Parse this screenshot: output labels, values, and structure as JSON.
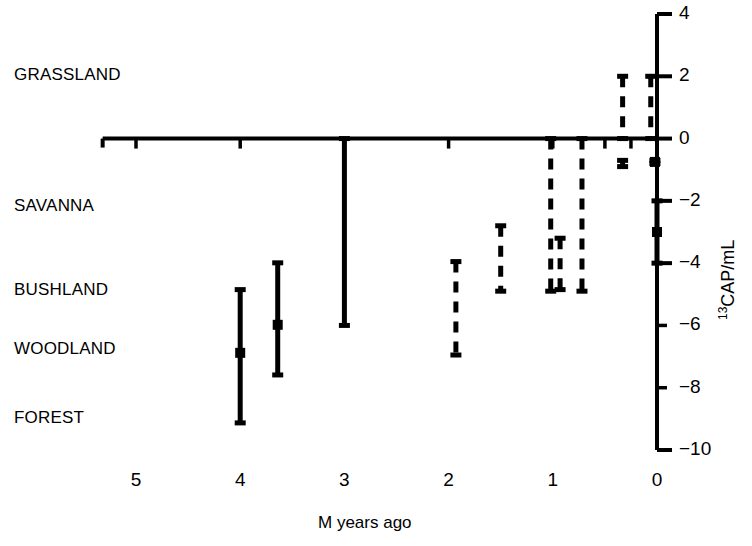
{
  "chart_data": {
    "type": "scatter",
    "title": "",
    "subtitle": "",
    "xlabel": "M years ago",
    "ylabel": "13CAP/mL",
    "ylabel_superscript": "13",
    "ylabel_base": "CAP/mL",
    "xlim": [
      5.3,
      -0.25
    ],
    "ylim": [
      -10,
      4
    ],
    "x_ticks": [
      5,
      4,
      3,
      2,
      1,
      0
    ],
    "y_ticks": [
      4,
      2,
      0,
      -2,
      -4,
      -6,
      -8,
      -10
    ],
    "y_tick_labels": [
      "4",
      "2",
      "0",
      "−2",
      "−4",
      "−6",
      "−8",
      "−10"
    ],
    "grid": false,
    "legend": false,
    "x_axis_position_y": 0,
    "y_axis_position_x": 0,
    "biome_bands": [
      {
        "label": "GRASSLAND",
        "value": 2.0
      },
      {
        "label": "SAVANNA",
        "value": -2.2
      },
      {
        "label": "BUSHLAND",
        "value": -4.9
      },
      {
        "label": "WOODLAND",
        "value": -6.8
      },
      {
        "label": "FOREST",
        "value": -9.0
      }
    ],
    "series": [
      {
        "name": "solid-intervals",
        "style": "solid",
        "points": [
          {
            "x": 4.0,
            "y": -6.88,
            "low": -9.13,
            "high": -4.85,
            "has_point": true
          },
          {
            "x": 3.64,
            "y": -5.98,
            "low": -7.59,
            "high": -3.99,
            "has_point": true
          },
          {
            "x": 3.0,
            "y": null,
            "low": -6.0,
            "high": 0.0,
            "has_point": false
          },
          {
            "x": 0.0,
            "y": -3.0,
            "low": -4.0,
            "high": -2.0,
            "has_point": true
          },
          {
            "x": 0.02,
            "y": -0.75,
            "low": -0.8,
            "high": -0.7,
            "has_point": true
          }
        ]
      },
      {
        "name": "dashed-intervals",
        "style": "dashed",
        "points": [
          {
            "x": 1.93,
            "y": null,
            "low": -6.95,
            "high": -3.95,
            "has_point": false
          },
          {
            "x": 1.5,
            "y": null,
            "low": -4.9,
            "high": -2.8,
            "has_point": false
          },
          {
            "x": 1.02,
            "y": null,
            "low": -4.9,
            "high": 0.0,
            "has_point": false
          },
          {
            "x": 0.93,
            "y": null,
            "low": -4.85,
            "high": -3.2,
            "has_point": false
          },
          {
            "x": 0.72,
            "y": null,
            "low": -4.9,
            "high": 0.0,
            "has_point": false
          },
          {
            "x": 0.33,
            "y": null,
            "low": 0.0,
            "high": 2.0,
            "has_point": false
          },
          {
            "x": 0.33,
            "y": null,
            "low": -0.9,
            "high": -0.7,
            "has_point": false
          },
          {
            "x": 0.06,
            "y": null,
            "low": 0.0,
            "high": 2.0,
            "has_point": false
          }
        ]
      }
    ]
  },
  "axes": {
    "x_title": "M years ago",
    "y_title_superscript": "13",
    "y_title_base": "CAP/mL"
  },
  "labels": {
    "grassland": "GRASSLAND",
    "savanna": "SAVANNA",
    "bushland": "BUSHLAND",
    "woodland": "WOODLAND",
    "forest": "FOREST"
  },
  "xticks": [
    "5",
    "4",
    "3",
    "2",
    "1",
    "0"
  ],
  "yticks": [
    "4",
    "2",
    "0",
    "−2",
    "−4",
    "−6",
    "−8",
    "−10"
  ],
  "colors": {
    "ink": "#000000",
    "background": "#ffffff"
  }
}
